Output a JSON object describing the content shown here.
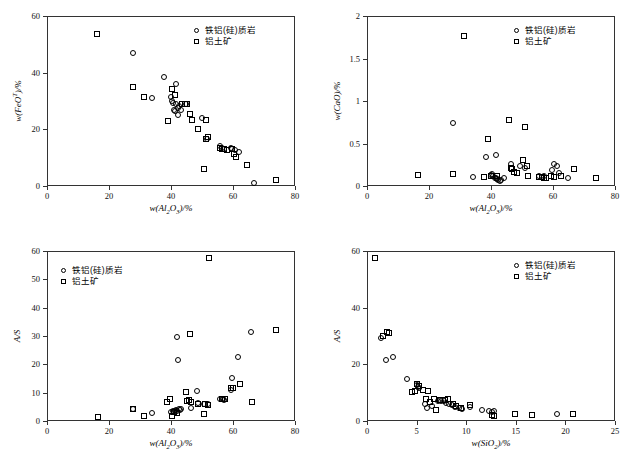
{
  "figure": {
    "panel_count": 4,
    "legend_entries": [
      {
        "marker": "circle-marker-icon",
        "label": "铁铝(硅)质岩"
      },
      {
        "marker": "square-marker-icon",
        "label": "铝土矿"
      }
    ]
  },
  "chart_data": [
    {
      "type": "scatter",
      "panel": "top-left",
      "title": "",
      "xlabel": "w(Al2O3)/%",
      "ylabel": "w(FeOT)/%",
      "xlim": [
        0,
        80
      ],
      "ylim": [
        0,
        60
      ],
      "xticks": [
        0,
        20,
        40,
        60,
        80
      ],
      "yticks": [
        0,
        20,
        40,
        60
      ],
      "grid": false,
      "legend_position": "top-right",
      "series": [
        {
          "name": "铁铝(硅)质岩",
          "marker": "circle",
          "points": [
            [
              27.8,
              46.8
            ],
            [
              33.9,
              31.2
            ],
            [
              37.6,
              38.3
            ],
            [
              41.6,
              36.1
            ],
            [
              39.9,
              31.4
            ],
            [
              40.4,
              30.1
            ],
            [
              40.8,
              29.4
            ],
            [
              41.1,
              26.9
            ],
            [
              41.3,
              26.4
            ],
            [
              41.6,
              28.9
            ],
            [
              42.3,
              25.0
            ],
            [
              42.1,
              27.6
            ],
            [
              42.7,
              28.3
            ],
            [
              43.2,
              26.7
            ],
            [
              44.9,
              29.1
            ],
            [
              50.0,
              23.9
            ],
            [
              51.5,
              16.6
            ],
            [
              55.9,
              14.2
            ],
            [
              56.6,
              13.3
            ],
            [
              57.2,
              12.9
            ],
            [
              59.2,
              13.3
            ],
            [
              59.8,
              13.1
            ],
            [
              60.5,
              12.8
            ],
            [
              61.8,
              12.1
            ],
            [
              66.9,
              1.0
            ]
          ]
        },
        {
          "name": "铝土矿",
          "marker": "square",
          "points": [
            [
              16.2,
              53.5
            ],
            [
              27.6,
              34.9
            ],
            [
              31.3,
              31.3
            ],
            [
              39.0,
              22.9
            ],
            [
              40.2,
              34.1
            ],
            [
              41.2,
              32.1
            ],
            [
              43.5,
              29.0
            ],
            [
              44.4,
              28.9
            ],
            [
              45.3,
              29.0
            ],
            [
              46.2,
              25.3
            ],
            [
              46.8,
              23.4
            ],
            [
              48.6,
              20.2
            ],
            [
              50.8,
              6.1
            ],
            [
              51.3,
              23.4
            ],
            [
              51.2,
              16.6
            ],
            [
              52.0,
              17.3
            ],
            [
              55.7,
              13.3
            ],
            [
              56.5,
              13.1
            ],
            [
              57.0,
              13.0
            ],
            [
              58.0,
              12.6
            ],
            [
              59.8,
              13.0
            ],
            [
              60.4,
              11.4
            ],
            [
              60.9,
              10.1
            ],
            [
              64.5,
              7.4
            ],
            [
              73.9,
              2.2
            ]
          ]
        }
      ]
    },
    {
      "type": "scatter",
      "panel": "top-right",
      "title": "",
      "xlabel": "w(Al2O3)/%",
      "ylabel": "w(CaO)/%",
      "xlim": [
        0,
        80
      ],
      "ylim": [
        0,
        2.0
      ],
      "xticks": [
        0,
        20,
        40,
        60,
        80
      ],
      "yticks": [
        0,
        0.5,
        1.0,
        1.5,
        2.0
      ],
      "grid": false,
      "legend_position": "top-right",
      "series": [
        {
          "name": "铁铝(硅)质岩",
          "marker": "circle",
          "points": [
            [
              27.8,
              0.74
            ],
            [
              34.2,
              0.11
            ],
            [
              38.3,
              0.34
            ],
            [
              41.6,
              0.36
            ],
            [
              39.9,
              0.13
            ],
            [
              40.4,
              0.14
            ],
            [
              40.8,
              0.12
            ],
            [
              41.2,
              0.1
            ],
            [
              41.5,
              0.09
            ],
            [
              41.9,
              0.08
            ],
            [
              42.3,
              0.07
            ],
            [
              43.2,
              0.07
            ],
            [
              44.3,
              0.09
            ],
            [
              46.6,
              0.26
            ],
            [
              49.5,
              0.24
            ],
            [
              51.0,
              0.21
            ],
            [
              55.5,
              0.12
            ],
            [
              56.5,
              0.11
            ],
            [
              57.0,
              0.12
            ],
            [
              59.8,
              0.19
            ],
            [
              60.4,
              0.26
            ],
            [
              61.4,
              0.23
            ],
            [
              62.0,
              0.15
            ],
            [
              64.9,
              0.09
            ],
            [
              42.8,
              0.06
            ]
          ]
        },
        {
          "name": "铝土矿",
          "marker": "square",
          "points": [
            [
              16.3,
              0.13
            ],
            [
              27.9,
              0.14
            ],
            [
              31.2,
              1.77
            ],
            [
              37.8,
              0.11
            ],
            [
              39.0,
              0.55
            ],
            [
              40.0,
              0.12
            ],
            [
              41.8,
              0.12
            ],
            [
              45.9,
              0.78
            ],
            [
              46.3,
              0.21
            ],
            [
              46.8,
              0.2
            ],
            [
              47.3,
              0.16
            ],
            [
              48.5,
              0.15
            ],
            [
              50.3,
              0.31
            ],
            [
              51.1,
              0.69
            ],
            [
              51.6,
              0.23
            ],
            [
              52.0,
              0.12
            ],
            [
              55.6,
              0.11
            ],
            [
              56.3,
              0.11
            ],
            [
              57.0,
              0.1
            ],
            [
              57.6,
              0.09
            ],
            [
              59.4,
              0.12
            ],
            [
              60.2,
              0.11
            ],
            [
              62.5,
              0.12
            ],
            [
              66.8,
              0.2
            ],
            [
              73.9,
              0.1
            ]
          ]
        }
      ]
    },
    {
      "type": "scatter",
      "panel": "bottom-left",
      "title": "",
      "xlabel": "w(Al2O3)/%",
      "ylabel": "A/S",
      "xlim": [
        0,
        80
      ],
      "ylim": [
        0,
        60
      ],
      "xticks": [
        0,
        20,
        40,
        60,
        80
      ],
      "yticks": [
        0,
        10,
        20,
        30,
        40,
        50,
        60
      ],
      "grid": false,
      "legend_position": "top-left",
      "series": [
        {
          "name": "铁铝(硅)质岩",
          "marker": "circle",
          "points": [
            [
              27.9,
              4.2
            ],
            [
              33.9,
              2.9
            ],
            [
              39.9,
              3.1
            ],
            [
              40.7,
              3.5
            ],
            [
              41.2,
              3.4
            ],
            [
              41.6,
              4.0
            ],
            [
              41.9,
              3.7
            ],
            [
              42.0,
              29.5
            ],
            [
              42.3,
              21.5
            ],
            [
              42.6,
              4.3
            ],
            [
              43.2,
              4.4
            ],
            [
              46.5,
              4.6
            ],
            [
              48.3,
              10.5
            ],
            [
              48.7,
              6.5
            ],
            [
              50.6,
              6.1
            ],
            [
              51.9,
              5.9
            ],
            [
              55.9,
              7.6
            ],
            [
              56.5,
              7.8
            ],
            [
              57.0,
              7.4
            ],
            [
              59.4,
              11.0
            ],
            [
              59.8,
              15.3
            ],
            [
              61.5,
              22.6
            ],
            [
              65.9,
              31.4
            ],
            [
              42.8,
              3.9
            ],
            [
              56.9,
              7.9
            ]
          ]
        },
        {
          "name": "铝土矿",
          "marker": "square",
          "points": [
            [
              16.3,
              1.3
            ],
            [
              27.9,
              4.1
            ],
            [
              31.2,
              1.8
            ],
            [
              38.8,
              6.6
            ],
            [
              39.8,
              7.9
            ],
            [
              40.2,
              1.9
            ],
            [
              41.0,
              3.2
            ],
            [
              41.8,
              2.9
            ],
            [
              44.7,
              10.1
            ],
            [
              45.3,
              7.2
            ],
            [
              45.7,
              7.5
            ],
            [
              46.0,
              30.6
            ],
            [
              46.3,
              6.8
            ],
            [
              48.6,
              6.0
            ],
            [
              50.5,
              2.6
            ],
            [
              51.0,
              6.1
            ],
            [
              51.9,
              5.8
            ],
            [
              52.2,
              57.5
            ],
            [
              56.3,
              7.6
            ],
            [
              57.4,
              7.8
            ],
            [
              59.4,
              11.5
            ],
            [
              60.0,
              11.8
            ],
            [
              62.3,
              13.0
            ],
            [
              66.2,
              6.6
            ],
            [
              73.8,
              32.0
            ]
          ]
        }
      ]
    },
    {
      "type": "scatter",
      "panel": "bottom-right",
      "title": "",
      "xlabel": "w(SiO2)/%",
      "ylabel": "A/S",
      "xlim": [
        0,
        25
      ],
      "ylim": [
        0,
        60
      ],
      "xticks": [
        0,
        5,
        10,
        15,
        20,
        25
      ],
      "yticks": [
        0,
        20,
        40,
        60
      ],
      "grid": false,
      "legend_position": "top-right",
      "series": [
        {
          "name": "铁铝(硅)质岩",
          "marker": "circle",
          "points": [
            [
              1.4,
              29.4
            ],
            [
              1.9,
              21.4
            ],
            [
              2.6,
              22.5
            ],
            [
              4.0,
              15.0
            ],
            [
              5.0,
              12.6
            ],
            [
              5.1,
              12.0
            ],
            [
              5.2,
              11.5
            ],
            [
              6.0,
              4.6
            ],
            [
              7.2,
              7.0
            ],
            [
              7.5,
              7.2
            ],
            [
              7.8,
              6.9
            ],
            [
              8.0,
              6.5
            ],
            [
              8.3,
              6.0
            ],
            [
              8.6,
              5.6
            ],
            [
              8.9,
              5.0
            ],
            [
              9.3,
              4.5
            ],
            [
              9.6,
              4.3
            ],
            [
              10.4,
              5.0
            ],
            [
              11.6,
              3.9
            ],
            [
              12.3,
              3.4
            ],
            [
              12.6,
              3.1
            ],
            [
              12.8,
              3.4
            ],
            [
              19.2,
              2.4
            ],
            [
              6.6,
              5.2
            ],
            [
              5.8,
              6.1
            ]
          ]
        },
        {
          "name": "铝土矿",
          "marker": "square",
          "points": [
            [
              0.8,
              57.5
            ],
            [
              1.6,
              30.0
            ],
            [
              2.0,
              31.5
            ],
            [
              2.2,
              31.0
            ],
            [
              4.5,
              10.3
            ],
            [
              4.8,
              10.6
            ],
            [
              5.0,
              13.0
            ],
            [
              5.2,
              12.3
            ],
            [
              5.6,
              10.9
            ],
            [
              5.9,
              7.6
            ],
            [
              6.1,
              10.6
            ],
            [
              6.4,
              6.6
            ],
            [
              6.8,
              7.9
            ],
            [
              7.0,
              3.8
            ],
            [
              7.4,
              7.3
            ],
            [
              7.9,
              7.4
            ],
            [
              8.2,
              7.6
            ],
            [
              8.7,
              6.1
            ],
            [
              9.0,
              5.2
            ],
            [
              9.5,
              4.6
            ],
            [
              10.4,
              5.6
            ],
            [
              12.6,
              2.2
            ],
            [
              12.8,
              1.6
            ],
            [
              14.9,
              2.5
            ],
            [
              16.6,
              2.0
            ],
            [
              20.8,
              2.4
            ]
          ]
        }
      ]
    }
  ]
}
